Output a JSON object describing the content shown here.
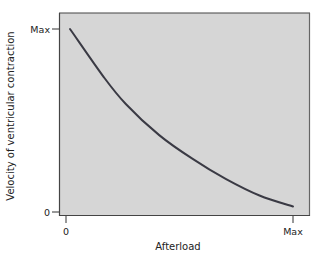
{
  "chart_data": {
    "type": "line",
    "title": "",
    "xlabel": "Afterload",
    "ylabel": "Velocity of ventricular contraction",
    "x_ticks": [
      "0",
      "Max"
    ],
    "y_ticks": [
      "0",
      "Max"
    ],
    "xlim": [
      0,
      1
    ],
    "ylim": [
      0,
      1
    ],
    "grid": false,
    "legend": null,
    "series": [
      {
        "name": "Force-velocity relationship",
        "x": [
          0.0,
          0.15,
          0.25,
          0.4,
          0.55,
          0.7,
          0.85,
          1.0
        ],
        "y": [
          1.0,
          0.74,
          0.59,
          0.42,
          0.29,
          0.18,
          0.09,
          0.03
        ]
      }
    ],
    "colors": {
      "plot_background": "#d6d6d6",
      "curve": "#3a3a44",
      "frame": "#555555"
    }
  }
}
